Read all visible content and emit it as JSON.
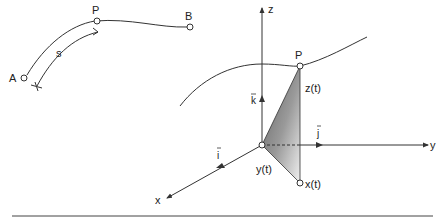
{
  "left_figure": {
    "point_a": "A",
    "point_p": "P",
    "point_b": "B",
    "arc_length": "s"
  },
  "right_figure": {
    "axis_x": "x",
    "axis_y": "y",
    "axis_z": "z",
    "unit_i": "i",
    "unit_j": "j",
    "unit_k": "k",
    "point_p": "P",
    "coord_x": "x(t)",
    "coord_y": "y(t)",
    "coord_z": "z(t)"
  },
  "colors": {
    "stroke": "#333333",
    "shade_dark": "#6a6a6a",
    "shade_light": "#e8e8e8"
  }
}
